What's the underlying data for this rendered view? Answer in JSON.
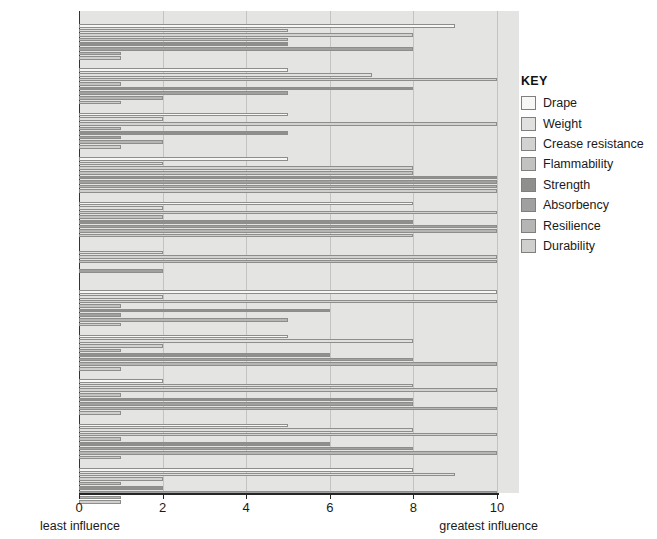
{
  "chart_data": {
    "type": "bar",
    "orientation": "horizontal",
    "title": "",
    "xlabel": "",
    "ylabel": "",
    "xlim": [
      0,
      10
    ],
    "xticks": [
      0,
      2,
      4,
      6,
      8,
      10
    ],
    "grid": true,
    "legend_position": "right",
    "axis_min_label": "least influence",
    "axis_max_label": "greatest influence",
    "legend_title": "KEY",
    "categories": [
      "Acetate",
      "Acrylic",
      "Elastane",
      "Nylon",
      "Polyester",
      "Tencel",
      "Viscose",
      "Cotton",
      "Linen",
      "Silk",
      "Wool"
    ],
    "series": [
      {
        "name": "Drape",
        "color": "#f7f7f5",
        "values": [
          9,
          5,
          5,
          5,
          8,
          0,
          10,
          5,
          2,
          5,
          8
        ]
      },
      {
        "name": "Weight",
        "color": "#e0e0de",
        "values": [
          5,
          7,
          2,
          2,
          2,
          2,
          2,
          8,
          8,
          8,
          9
        ]
      },
      {
        "name": "Crease resistance",
        "color": "#d2d2d0",
        "values": [
          8,
          10,
          10,
          8,
          10,
          10,
          10,
          2,
          10,
          10,
          2
        ]
      },
      {
        "name": "Flammability",
        "color": "#c2c2c0",
        "values": [
          5,
          1,
          1,
          8,
          2,
          10,
          1,
          1,
          1,
          1,
          1
        ]
      },
      {
        "name": "Strength",
        "color": "#8f8f8d",
        "values": [
          5,
          8,
          5,
          10,
          8,
          0,
          6,
          6,
          8,
          6,
          2
        ]
      },
      {
        "name": "Absorbency",
        "color": "#a0a0a0",
        "values": [
          8,
          5,
          1,
          10,
          10,
          2,
          1,
          8,
          8,
          8,
          10
        ]
      },
      {
        "name": "Resilience",
        "color": "#b5b5b3",
        "values": [
          1,
          2,
          2,
          10,
          10,
          0,
          5,
          10,
          10,
          10,
          1
        ]
      },
      {
        "name": "Durability",
        "color": "#cfcfcd",
        "values": [
          1,
          1,
          1,
          10,
          8,
          0,
          1,
          1,
          1,
          1,
          1
        ]
      }
    ]
  },
  "legend": {
    "title": "KEY",
    "items": [
      {
        "label": "Drape"
      },
      {
        "label": "Weight"
      },
      {
        "label": "Crease resistance"
      },
      {
        "label": "Flammability"
      },
      {
        "label": "Strength"
      },
      {
        "label": "Absorbency"
      },
      {
        "label": "Resilience"
      },
      {
        "label": "Durability"
      }
    ]
  },
  "axis": {
    "ticks": [
      "0",
      "2",
      "4",
      "6",
      "8",
      "10"
    ],
    "least": "least influence",
    "greatest": "greatest influence"
  }
}
